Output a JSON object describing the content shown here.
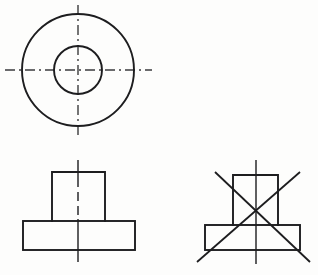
{
  "sheet": {
    "title": "Orthographic Projection Drawing",
    "description": "Engineering drawing of a flanged cylindrical boss shown in top view and two alternative front views",
    "background_color": "#fdfdfc",
    "line_color": "#1d1d1f",
    "centerline_color": "#2a2a2c",
    "width": 318,
    "height": 275
  },
  "views": {
    "top_view": {
      "name": "top-view",
      "type": "circles",
      "center": {
        "x": 78,
        "y": 70
      },
      "outer_circle": {
        "cx": 78,
        "cy": 70,
        "r": 56
      },
      "inner_circle": {
        "cx": 78,
        "cy": 70,
        "r": 24
      },
      "horizontal_centerline": {
        "x1": 5,
        "y1": 70,
        "x2": 152,
        "y2": 70
      },
      "vertical_centerline": {
        "x1": 78,
        "y1": 5,
        "x2": 78,
        "y2": 135
      }
    },
    "front_view_correct": {
      "name": "front-view-correct",
      "type": "tee-profile",
      "status": "accepted",
      "boss": {
        "x": 52,
        "y": 172,
        "width": 53,
        "height": 49
      },
      "base": {
        "x": 23,
        "y": 221,
        "width": 112,
        "height": 29
      },
      "centerline_top": {
        "x1": 78,
        "y1": 160,
        "x2": 78,
        "y2": 178
      },
      "centerline_dashed": {
        "x1": 78,
        "y1": 178,
        "x2": 78,
        "y2": 219
      },
      "centerline_bottom": {
        "x1": 78,
        "y1": 219,
        "x2": 78,
        "y2": 262
      }
    },
    "front_view_rejected": {
      "name": "front-view-rejected",
      "type": "tee-profile",
      "status": "rejected",
      "boss": {
        "x": 233,
        "y": 175,
        "width": 45,
        "height": 50
      },
      "base": {
        "x": 205,
        "y": 225,
        "width": 95,
        "height": 25
      },
      "centerline": {
        "x1": 256,
        "y1": 160,
        "x2": 256,
        "y2": 264
      },
      "reject_mark": {
        "name": "reject-cross",
        "stroke_1": {
          "x1": 215,
          "y1": 172,
          "x2": 310,
          "y2": 262
        },
        "stroke_2": {
          "x1": 300,
          "y1": 172,
          "x2": 197,
          "y2": 262
        }
      }
    }
  }
}
